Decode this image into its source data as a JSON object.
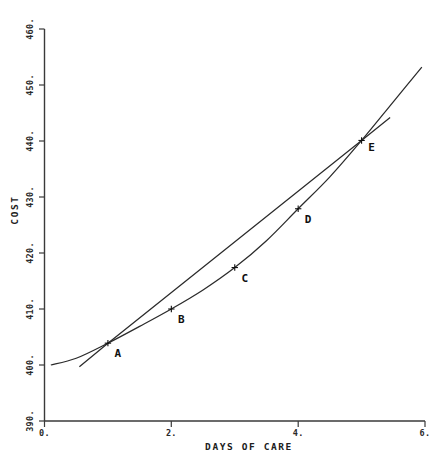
{
  "chart_data": {
    "type": "line",
    "title": "",
    "xlabel": "DAYS OF CARE",
    "ylabel": "COST",
    "xlim": [
      0,
      6
    ],
    "ylim": [
      390,
      460
    ],
    "grid": false,
    "legend": "none",
    "x_tick_labels": [
      "0.",
      "2.",
      "4.",
      "6."
    ],
    "x_tick_values": [
      0,
      2,
      4,
      6
    ],
    "x_minor_tick_values": [
      1,
      3,
      5
    ],
    "y_tick_labels": [
      "460.",
      "450.",
      "440.",
      "430.",
      "420.",
      "410.",
      "400.",
      "390."
    ],
    "y_tick_values": [
      460,
      450,
      440,
      430,
      420,
      410,
      400,
      390
    ],
    "series": [
      {
        "name": "cost-curve",
        "style": "curve",
        "x": [
          0.1,
          0.5,
          1.0,
          1.5,
          2.0,
          2.5,
          3.0,
          3.5,
          4.0,
          4.5,
          5.0,
          5.5,
          5.95
        ],
        "y": [
          400.0,
          401.2,
          403.9,
          406.9,
          410.0,
          413.4,
          417.4,
          422.2,
          427.9,
          433.6,
          440.1,
          447.0,
          453.2
        ]
      },
      {
        "name": "secant-line",
        "style": "straight",
        "x": [
          0.55,
          1.0,
          5.0,
          5.45
        ],
        "y": [
          399.7,
          403.9,
          440.1,
          444.2
        ]
      }
    ],
    "points": [
      {
        "label": "A",
        "x": 1.0,
        "y": 403.9
      },
      {
        "label": "B",
        "x": 2.0,
        "y": 410.0
      },
      {
        "label": "C",
        "x": 3.0,
        "y": 417.4
      },
      {
        "label": "D",
        "x": 4.0,
        "y": 427.9
      },
      {
        "label": "E",
        "x": 5.0,
        "y": 440.1
      }
    ],
    "annotations": [
      {
        "text": "A",
        "x": 1.0,
        "y": 403.9
      },
      {
        "text": "B",
        "x": 2.0,
        "y": 410.0
      },
      {
        "text": "C",
        "x": 3.0,
        "y": 417.4
      },
      {
        "text": "D",
        "x": 4.0,
        "y": 427.9
      },
      {
        "text": "E",
        "x": 5.0,
        "y": 440.1
      }
    ],
    "colors": {
      "axis": "#3a3a3a",
      "curve": "#2b2b2b",
      "text": "#202020",
      "background": "#ffffff"
    }
  },
  "axes": {
    "y_title": "COST",
    "x_title": "DAYS OF CARE",
    "y_ticks": [
      {
        "label": "460."
      },
      {
        "label": "450."
      },
      {
        "label": "440."
      },
      {
        "label": "430."
      },
      {
        "label": "420."
      },
      {
        "label": "410."
      },
      {
        "label": "400."
      },
      {
        "label": "390."
      }
    ],
    "x_ticks": [
      {
        "label": "0."
      },
      {
        "label": "2."
      },
      {
        "label": "4."
      },
      {
        "label": "6."
      }
    ]
  },
  "point_labels": {
    "a": "A",
    "b": "B",
    "c": "C",
    "d": "D",
    "e": "E"
  }
}
